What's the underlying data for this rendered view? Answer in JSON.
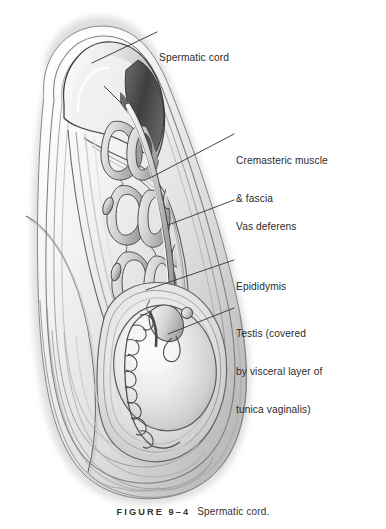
{
  "figure": {
    "caption_number": "FIGURE 9–4",
    "caption_title": "Spermatic cord."
  },
  "labels": {
    "spermatic_cord": {
      "lines": [
        "Spermatic cord"
      ],
      "line1": "Spermatic cord"
    },
    "cremasteric": {
      "line1": "Cremasteric muscle",
      "line2": "& fascia"
    },
    "vas_deferens": {
      "line1": "Vas deferens"
    },
    "epididymis": {
      "line1": "Epididymis"
    },
    "testis": {
      "line1": "Testis (covered",
      "line2": "by visceral layer of",
      "line3": "tunica vaginalis)"
    }
  },
  "colors": {
    "leader_line": "#3c3c3c",
    "outline": "#4a4a4a",
    "text": "#2b2b2b",
    "page_background": "#ffffff",
    "tissue_light": "#eeeeee",
    "tissue_mid": "#c9c9c9",
    "tissue_dark": "#8d8d8d",
    "shadow_dark": "#4b4b4b"
  }
}
